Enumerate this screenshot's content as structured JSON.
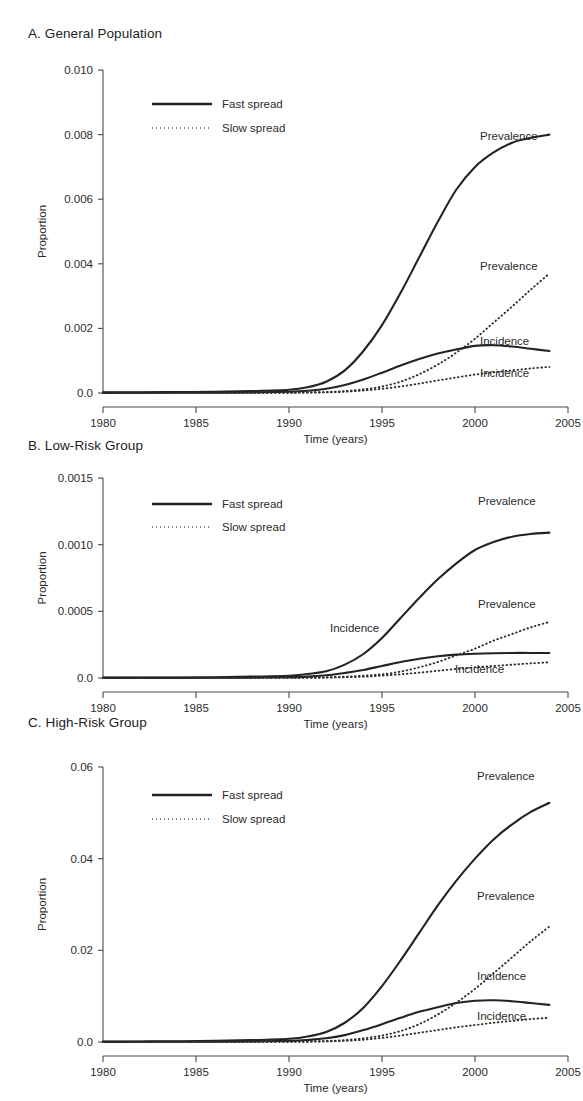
{
  "figure": {
    "caption_panels": [
      "A. General Population",
      "B. Low-Risk Group",
      "C. High-Risk Group"
    ],
    "shared_xlabel": "Time (years)",
    "shared_ylabel": "Proportion",
    "legend": {
      "fast_label": "Fast spread",
      "slow_label": "Slow spread"
    },
    "annotations": {
      "prevalence": "Prevalence",
      "incidence": "Incidence"
    }
  },
  "chart_data": [
    {
      "type": "line",
      "panel_id": "A",
      "title": "A. General Population",
      "xlabel": "Time (years)",
      "ylabel": "Proportion",
      "xlim": [
        1980,
        2005
      ],
      "ylim": [
        0,
        0.01
      ],
      "xticks": [
        1980,
        1985,
        1990,
        1995,
        2000,
        2005
      ],
      "xticklabels": [
        "1980",
        "1985",
        "1990",
        "1995",
        "2000",
        "2005"
      ],
      "yticks": [
        0.0,
        0.002,
        0.004,
        0.006,
        0.008,
        0.01
      ],
      "yticklabels": [
        "0.0",
        "0.002",
        "0.004",
        "0.006",
        "0.008",
        "0.010"
      ],
      "grid": false,
      "legend_position": "upper-left-inside",
      "x": [
        1980,
        1982,
        1984,
        1986,
        1988,
        1990,
        1991,
        1992,
        1993,
        1994,
        1995,
        1996,
        1997,
        1998,
        1999,
        2000,
        2001,
        2002,
        2003,
        2004
      ],
      "series": [
        {
          "name": "Prevalence",
          "style": "Fast spread",
          "linestyle": "solid",
          "annotation": "Prevalence",
          "values": [
            2e-05,
            2e-05,
            3e-05,
            4e-05,
            6e-05,
            0.0001,
            0.00018,
            0.00035,
            0.0007,
            0.0013,
            0.0021,
            0.0031,
            0.0042,
            0.0053,
            0.0063,
            0.007,
            0.00745,
            0.00775,
            0.0079,
            0.008
          ]
        },
        {
          "name": "Incidence",
          "style": "Fast spread",
          "linestyle": "solid",
          "annotation": "Incidence",
          "values": [
            5e-06,
            6e-06,
            8e-06,
            1e-05,
            1.8e-05,
            4e-05,
            7e-05,
            0.00013,
            0.00025,
            0.00042,
            0.00063,
            0.00085,
            0.00105,
            0.00122,
            0.00135,
            0.00146,
            0.00148,
            0.00144,
            0.00137,
            0.0013
          ]
        },
        {
          "name": "Prevalence",
          "style": "Slow spread",
          "linestyle": "dotted",
          "annotation": "Prevalence",
          "values": [
            2e-06,
            2e-06,
            3e-06,
            4e-06,
            6e-06,
            1e-05,
            1.8e-05,
            3e-05,
            6e-05,
            0.00011,
            0.0002,
            0.00035,
            0.00058,
            0.00088,
            0.00125,
            0.00168,
            0.00218,
            0.00268,
            0.0032,
            0.0037
          ]
        },
        {
          "name": "Incidence",
          "style": "Slow spread",
          "linestyle": "dotted",
          "annotation": "Incidence",
          "values": [
            1e-06,
            1e-06,
            2e-06,
            3e-06,
            4e-06,
            8e-06,
            1.3e-05,
            2e-05,
            4e-05,
            8e-05,
            0.00013,
            0.0002,
            0.00029,
            0.00039,
            0.00048,
            0.00057,
            0.00064,
            0.0007,
            0.00076,
            0.00081
          ]
        }
      ]
    },
    {
      "type": "line",
      "panel_id": "B",
      "title": "B. Low-Risk Group",
      "xlabel": "Time (years)",
      "ylabel": "Proportion",
      "xlim": [
        1980,
        2005
      ],
      "ylim": [
        0,
        0.0015
      ],
      "xticks": [
        1980,
        1985,
        1990,
        1995,
        2000,
        2005
      ],
      "xticklabels": [
        "1980",
        "1985",
        "1990",
        "1995",
        "2000",
        "2005"
      ],
      "yticks": [
        0.0,
        0.0005,
        0.001,
        0.0015
      ],
      "yticklabels": [
        "0.0",
        "0.0005",
        "0.0010",
        "0.0015"
      ],
      "grid": false,
      "legend_position": "upper-left-inside",
      "x": [
        1980,
        1982,
        1984,
        1986,
        1988,
        1990,
        1991,
        1992,
        1993,
        1994,
        1995,
        1996,
        1997,
        1998,
        1999,
        2000,
        2001,
        2002,
        2003,
        2004
      ],
      "series": [
        {
          "name": "Prevalence",
          "style": "Fast spread",
          "linestyle": "solid",
          "annotation": "Prevalence",
          "values": [
            3e-06,
            3e-06,
            4e-06,
            6e-06,
            1e-05,
            1.6e-05,
            3e-05,
            5e-05,
            0.0001,
            0.00018,
            0.0003,
            0.00045,
            0.0006,
            0.00074,
            0.00086,
            0.00096,
            0.00102,
            0.00106,
            0.00108,
            0.00109
          ]
        },
        {
          "name": "Incidence",
          "style": "Fast spread",
          "linestyle": "solid",
          "annotation": "Incidence",
          "values": [
            8e-07,
            1e-06,
            1.2e-06,
            1.8e-06,
            3e-06,
            6e-06,
            1e-05,
            2e-05,
            3.8e-05,
            6e-05,
            9e-05,
            0.00012,
            0.000145,
            0.000163,
            0.000175,
            0.000182,
            0.000186,
            0.000188,
            0.000188,
            0.000187
          ]
        },
        {
          "name": "Prevalence",
          "style": "Slow spread",
          "linestyle": "dotted",
          "annotation": "Prevalence",
          "values": [
            3e-07,
            3e-07,
            4e-07,
            6e-07,
            1e-06,
            1.6e-06,
            3e-06,
            5e-06,
            1e-05,
            1.7e-05,
            2.8e-05,
            4.8e-05,
            8e-05,
            0.00012,
            0.00017,
            0.00022,
            0.00028,
            0.00033,
            0.00038,
            0.00042
          ]
        },
        {
          "name": "Incidence",
          "style": "Slow spread",
          "linestyle": "dotted",
          "annotation": "Incidence",
          "values": [
            1e-07,
            2e-07,
            2e-07,
            3e-07,
            5e-07,
            1e-06,
            1.7e-06,
            3e-06,
            6e-06,
            1e-05,
            1.8e-05,
            2.8e-05,
            4e-05,
            5.4e-05,
            6.8e-05,
            8e-05,
            9e-05,
            0.0001,
            0.00011,
            0.000118
          ]
        }
      ]
    },
    {
      "type": "line",
      "panel_id": "C",
      "title": "C. High-Risk Group",
      "xlabel": "Time (years)",
      "ylabel": "Proportion",
      "xlim": [
        1980,
        2005
      ],
      "ylim": [
        0,
        0.06
      ],
      "xticks": [
        1980,
        1985,
        1990,
        1995,
        2000,
        2005
      ],
      "xticklabels": [
        "1980",
        "1985",
        "1990",
        "1995",
        "2000",
        "2005"
      ],
      "yticks": [
        0.0,
        0.02,
        0.04,
        0.06
      ],
      "yticklabels": [
        "0.0",
        "0.02",
        "0.04",
        "0.06"
      ],
      "grid": false,
      "legend_position": "upper-left-inside",
      "x": [
        1980,
        1982,
        1984,
        1986,
        1988,
        1990,
        1991,
        1992,
        1993,
        1994,
        1995,
        1996,
        1997,
        1998,
        1999,
        2000,
        2001,
        2002,
        2003,
        2004
      ],
      "series": [
        {
          "name": "Prevalence",
          "style": "Fast spread",
          "linestyle": "solid",
          "annotation": "Prevalence",
          "values": [
            0.0001,
            0.00012,
            0.00016,
            0.00024,
            0.0004,
            0.0007,
            0.0012,
            0.0022,
            0.0042,
            0.0075,
            0.0122,
            0.0178,
            0.0238,
            0.0298,
            0.0352,
            0.04,
            0.0442,
            0.0475,
            0.0502,
            0.0522
          ]
        },
        {
          "name": "Incidence",
          "style": "Fast spread",
          "linestyle": "solid",
          "annotation": "Incidence",
          "values": [
            3e-05,
            4e-05,
            5e-05,
            7e-05,
            0.00012,
            0.00025,
            0.00045,
            0.0008,
            0.0015,
            0.0026,
            0.0039,
            0.0053,
            0.0066,
            0.0076,
            0.0085,
            0.009,
            0.0091,
            0.0089,
            0.0085,
            0.0081
          ]
        },
        {
          "name": "Prevalence",
          "style": "Slow spread",
          "linestyle": "dotted",
          "annotation": "Prevalence",
          "values": [
            1e-05,
            1.2e-05,
            1.6e-05,
            2.4e-05,
            4e-05,
            7e-05,
            0.00012,
            0.00022,
            0.00042,
            0.0008,
            0.0014,
            0.0024,
            0.0039,
            0.006,
            0.0086,
            0.0116,
            0.015,
            0.0185,
            0.022,
            0.0252
          ]
        },
        {
          "name": "Incidence",
          "style": "Slow spread",
          "linestyle": "dotted",
          "annotation": "Incidence",
          "values": [
            5e-06,
            6e-06,
            8e-06,
            1.2e-05,
            2e-05,
            4e-05,
            7e-05,
            0.00013,
            0.00026,
            0.0005,
            0.0009,
            0.0014,
            0.002,
            0.0026,
            0.0032,
            0.0037,
            0.0042,
            0.0046,
            0.005,
            0.0053
          ]
        }
      ]
    }
  ]
}
